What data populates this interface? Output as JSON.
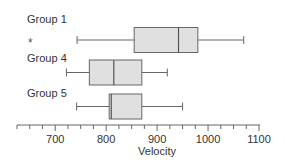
{
  "chart_data": {
    "type": "boxplot",
    "orientation": "horizontal",
    "title": "",
    "xlabel": "Velocity",
    "ylabel": "",
    "xlim": [
      625,
      1100
    ],
    "x_ticks": [
      700,
      800,
      900,
      1000,
      1100
    ],
    "x_tick_labels": [
      "700",
      "800",
      "900",
      "1000",
      "1100"
    ],
    "minor_tick_step": 25,
    "grid": false,
    "colors": {
      "box_fill": "#e0e0e0",
      "box_stroke": "#666666",
      "text": "#333333"
    },
    "series": [
      {
        "name": "Group 1",
        "whisker_low": 743,
        "q1": 855,
        "median": 942,
        "q3": 980,
        "whisker_high": 1070,
        "marker": "*"
      },
      {
        "name": "Group 4",
        "whisker_low": 722,
        "q1": 767,
        "median": 815,
        "q3": 870,
        "whisker_high": 920
      },
      {
        "name": "Group 5",
        "whisker_low": 742,
        "q1": 806,
        "median": 810,
        "q3": 870,
        "whisker_high": 950
      }
    ]
  },
  "labels": {
    "group1": "Group 1",
    "group4": "Group 4",
    "group5": "Group 5",
    "star": "*",
    "xlabel": "Velocity",
    "ticks": [
      "700",
      "800",
      "900",
      "1000",
      "1100"
    ]
  }
}
